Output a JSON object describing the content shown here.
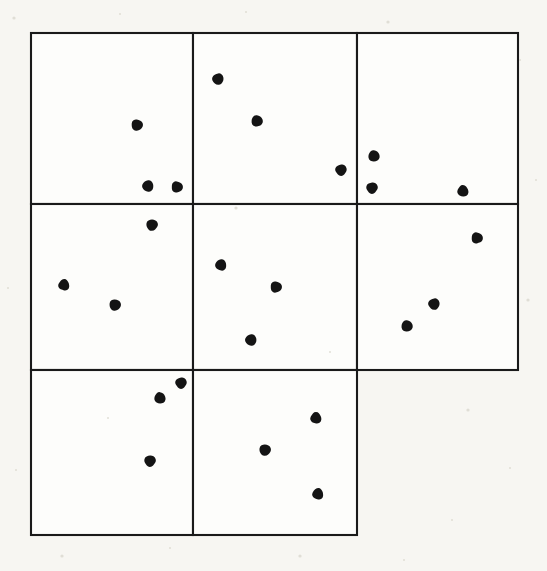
{
  "figure": {
    "title": "",
    "caption": "",
    "background_color": "#f7f6f2",
    "cell_fill_color": "#fdfdfb",
    "line_color": "#1a1a1a",
    "dot_color": "#141414",
    "dot_radius": 6,
    "line_width": 2.1,
    "grid": {
      "columns": 3,
      "rows": 3,
      "x_edges": [
        31,
        193,
        357,
        518
      ],
      "y_edges": [
        33,
        204,
        370,
        535
      ],
      "note": "bottom-right cell is absent"
    }
  },
  "chart_data": {
    "type": "scatter",
    "title": "",
    "xlabel": "",
    "ylabel": "",
    "xlim": [
      31,
      518
    ],
    "ylim": [
      33,
      535
    ],
    "grid": true,
    "legend": "none",
    "quadrat_count": 8,
    "point_count": 24,
    "points_per_quadrat": [
      3,
      3,
      3,
      3,
      3,
      3,
      3,
      3
    ],
    "cells": [
      {
        "id": "cell-r1c1",
        "row": 1,
        "col": 1,
        "x": 31,
        "y": 33,
        "width": 162,
        "height": 171,
        "count": 3,
        "points": [
          {
            "x": 137,
            "y": 125
          },
          {
            "x": 148,
            "y": 186
          },
          {
            "x": 177,
            "y": 187
          }
        ]
      },
      {
        "id": "cell-r1c2",
        "row": 1,
        "col": 2,
        "x": 193,
        "y": 33,
        "width": 164,
        "height": 171,
        "count": 3,
        "points": [
          {
            "x": 218,
            "y": 79
          },
          {
            "x": 257,
            "y": 121
          },
          {
            "x": 341,
            "y": 170
          }
        ]
      },
      {
        "id": "cell-r1c3",
        "row": 1,
        "col": 3,
        "x": 357,
        "y": 33,
        "width": 161,
        "height": 171,
        "count": 3,
        "points": [
          {
            "x": 374,
            "y": 156
          },
          {
            "x": 372,
            "y": 188
          },
          {
            "x": 463,
            "y": 191
          }
        ]
      },
      {
        "id": "cell-r2c1",
        "row": 2,
        "col": 1,
        "x": 31,
        "y": 204,
        "width": 162,
        "height": 166,
        "count": 3,
        "points": [
          {
            "x": 152,
            "y": 225
          },
          {
            "x": 64,
            "y": 285
          },
          {
            "x": 115,
            "y": 305
          }
        ]
      },
      {
        "id": "cell-r2c2",
        "row": 2,
        "col": 2,
        "x": 193,
        "y": 204,
        "width": 164,
        "height": 166,
        "count": 3,
        "points": [
          {
            "x": 221,
            "y": 265
          },
          {
            "x": 276,
            "y": 287
          },
          {
            "x": 251,
            "y": 340
          }
        ]
      },
      {
        "id": "cell-r2c3",
        "row": 2,
        "col": 3,
        "x": 357,
        "y": 204,
        "width": 161,
        "height": 166,
        "count": 3,
        "points": [
          {
            "x": 477,
            "y": 238
          },
          {
            "x": 434,
            "y": 304
          },
          {
            "x": 407,
            "y": 326
          }
        ]
      },
      {
        "id": "cell-r3c1",
        "row": 3,
        "col": 1,
        "x": 31,
        "y": 370,
        "width": 162,
        "height": 165,
        "count": 3,
        "points": [
          {
            "x": 181,
            "y": 383
          },
          {
            "x": 160,
            "y": 398
          },
          {
            "x": 150,
            "y": 461
          }
        ]
      },
      {
        "id": "cell-r3c2",
        "row": 3,
        "col": 2,
        "x": 193,
        "y": 370,
        "width": 164,
        "height": 165,
        "count": 3,
        "points": [
          {
            "x": 316,
            "y": 418
          },
          {
            "x": 265,
            "y": 450
          },
          {
            "x": 318,
            "y": 494
          }
        ]
      }
    ]
  }
}
